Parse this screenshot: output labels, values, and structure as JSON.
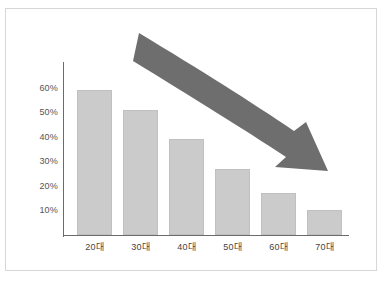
{
  "chart_data": {
    "type": "bar",
    "title": "",
    "subtitle": "",
    "xlabel": "",
    "ylabel": "",
    "categories": [
      "20대",
      "30대",
      "40대",
      "50대",
      "60대",
      "70대"
    ],
    "values": [
      59,
      51,
      39,
      27,
      17,
      10
    ],
    "value_unit": "%",
    "ylim": [
      0,
      65
    ],
    "yticks": [
      10,
      20,
      30,
      40,
      50,
      60
    ],
    "ytick_labels": [
      "10%",
      "20%",
      "30%",
      "40%",
      "50%",
      "60%"
    ],
    "grid": false,
    "legend": null,
    "legend_position": "none",
    "annotations": [
      {
        "name": "declining-trend-arrow",
        "kind": "curved-arrow",
        "direction": "down-right",
        "description": "Large curved gray arrow sweeping from upper left down to the right over the bars, indicating a declining trend"
      }
    ],
    "colors": {
      "bar_fill": "#cbcbcb",
      "bar_border": "#c0c0c0",
      "arrow": "#6e6e6e",
      "axis": "#6b6b6b",
      "tick_text": "#555555",
      "frame_border": "#d6d6d6",
      "background": "#ffffff"
    }
  },
  "caption": {
    "text": ""
  }
}
